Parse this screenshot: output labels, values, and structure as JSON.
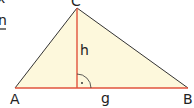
{
  "diagram": {
    "vertices": {
      "A": "A",
      "B": "B",
      "C": "C"
    },
    "height_label": "h",
    "base_label": "g",
    "right_angle_mark": "·",
    "corner_text": {
      "top": "x",
      "underlined": "n"
    },
    "colors": {
      "fill": "#fdf8dc",
      "base_and_height": "#e0533c",
      "sides": "#333333",
      "text": "#222222"
    }
  }
}
